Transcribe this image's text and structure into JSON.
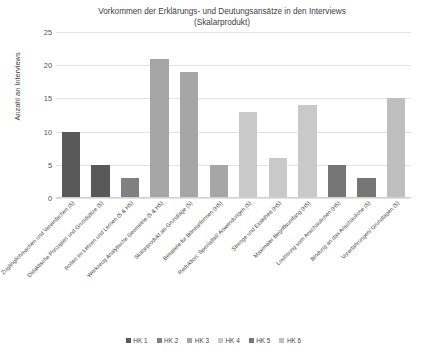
{
  "chart_data": {
    "type": "bar",
    "title": "Vorkommen der Erklärungs- und Deutungsansätze in den Interviews (Skalarprodukt)",
    "title_line1": "Vorkommen der Erklärungs- und Deutungsansätze in den Interviews",
    "title_line2": "(Skalarprodukt)",
    "xlabel": "",
    "ylabel": "Anzahl an Interviews",
    "ylim": [
      0,
      25
    ],
    "yticks": [
      0,
      5,
      10,
      15,
      20,
      25
    ],
    "ytick_labels": [
      "0",
      "5",
      "10",
      "15",
      "20",
      "25"
    ],
    "grid": true,
    "legend_position": "bottom",
    "categories": [
      "Zugänglichmachen und Vereinfachen (5)",
      "Didaktische Prinzipien und Grundsätze (5)",
      "Rollen im Lehren und Lernen (5 & H5)",
      "Werkzeug Analytische Geometrie (5 & H5)",
      "Skalarprodukt als Grundlage (5)",
      "Beispiele für Bilinearformen (H5)",
      "Reduktion: Spezialfall/ Anwendungen (5)",
      "Strenge und Exaktheit (H5)",
      "Maximaler Begriffsumfang (H5)",
      "Loslösung vom Anschaulichen (H5)",
      "Bindung an das Anschauliche (5)",
      "Vorerfahrungen/ Grundlagen (5)"
    ],
    "values": [
      10,
      5,
      3,
      21,
      19,
      5,
      13,
      6,
      14,
      5,
      3,
      15
    ],
    "bar_groups": [
      "HK 1",
      "HK 1",
      "HK 2",
      "HK 3",
      "HK 3",
      "HK 3",
      "HK 4",
      "HK 4",
      "HK 4",
      "HK 5",
      "HK 5",
      "HK 6"
    ],
    "bar_colors": [
      "#595959",
      "#595959",
      "#808080",
      "#a6a6a6",
      "#a6a6a6",
      "#a6a6a6",
      "#c9c9c9",
      "#c9c9c9",
      "#c9c9c9",
      "#767676",
      "#767676",
      "#bfbfbf"
    ],
    "legend": [
      {
        "label": "HK 1",
        "color": "#595959"
      },
      {
        "label": "HK 2",
        "color": "#808080"
      },
      {
        "label": "HK 3",
        "color": "#a6a6a6"
      },
      {
        "label": "HK 4",
        "color": "#c9c9c9"
      },
      {
        "label": "HK 5",
        "color": "#767676"
      },
      {
        "label": "HK 6",
        "color": "#bfbfbf"
      }
    ]
  }
}
